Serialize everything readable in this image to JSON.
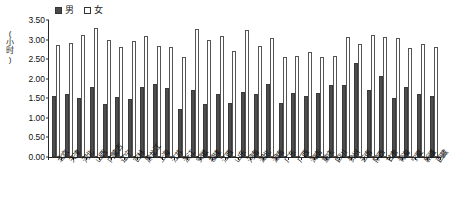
{
  "legend": {
    "entries": [
      {
        "key": "male",
        "label": "男",
        "color": "#4d4d4d"
      },
      {
        "key": "female",
        "label": "女",
        "color": "#ffffff"
      }
    ]
  },
  "axis": {
    "y_unit_label": "(小时)",
    "y_ticks": [
      "0.00",
      "0.50",
      "1.00",
      "1.50",
      "2.00",
      "2.50",
      "3.00",
      "3.50"
    ]
  },
  "chart_data": {
    "type": "bar",
    "title": "",
    "xlabel": "",
    "ylabel": "(小时)",
    "ylim": [
      0,
      3.5
    ],
    "ytick_step": 0.5,
    "grid": false,
    "legend_position": "top-left",
    "categories": [
      "北京",
      "天津",
      "河北",
      "山西",
      "内蒙古",
      "辽宁",
      "吉林",
      "黑龙江",
      "上海",
      "江苏",
      "浙江",
      "安徽",
      "福建",
      "江西",
      "山东",
      "河南",
      "湖北",
      "湖南",
      "广东",
      "广西",
      "海南",
      "重庆",
      "四川",
      "贵州",
      "云南",
      "陕西",
      "甘肃",
      "青海",
      "宁夏",
      "新疆",
      "西藏"
    ],
    "series": [
      {
        "name": "男",
        "color": "#4d4d4d",
        "values": [
          1.55,
          1.6,
          1.5,
          1.8,
          1.36,
          1.54,
          1.48,
          1.8,
          1.86,
          1.77,
          1.23,
          1.71,
          1.36,
          1.62,
          1.37,
          1.67,
          1.6,
          1.86,
          1.39,
          1.63,
          1.56,
          1.64,
          1.85,
          1.83,
          2.4,
          1.72,
          2.07,
          1.52,
          1.78,
          1.6,
          1.55
        ]
      },
      {
        "name": "女",
        "color": "#ffffff",
        "values": [
          2.85,
          2.92,
          3.12,
          3.3,
          3.0,
          2.8,
          2.97,
          3.08,
          2.84,
          2.8,
          2.56,
          3.26,
          3.0,
          3.08,
          2.72,
          3.24,
          2.84,
          3.04,
          2.55,
          2.58,
          2.68,
          2.56,
          2.58,
          3.06,
          2.89,
          3.12,
          3.06,
          3.04,
          2.78,
          2.9,
          2.8
        ]
      }
    ]
  }
}
